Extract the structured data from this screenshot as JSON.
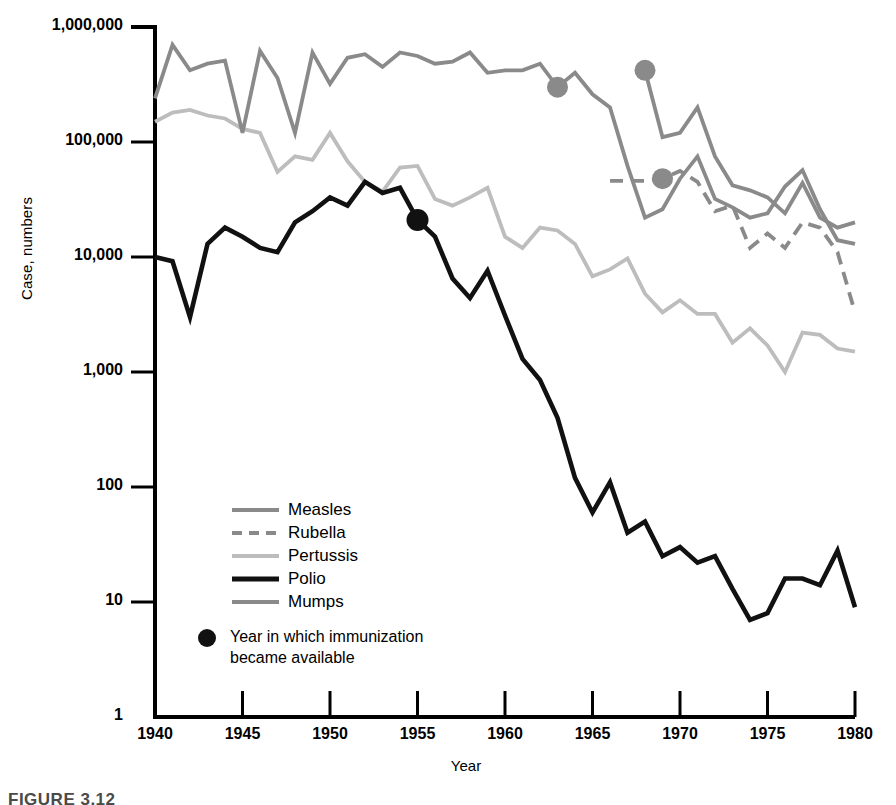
{
  "axes": {
    "y_label": "Case, numbers",
    "x_label": "Year",
    "y_ticks": [
      "1,000,000",
      "100,000",
      "10,000",
      "1,000",
      "100",
      "10",
      "1"
    ],
    "x_ticks": [
      "1940",
      "1945",
      "1950",
      "1955",
      "1960",
      "1965",
      "1970",
      "1975",
      "1980"
    ]
  },
  "legend": {
    "items": [
      {
        "label": "Measles",
        "color": "#8a8a8a",
        "style": "solid"
      },
      {
        "label": "Rubella",
        "color": "#8a8a8a",
        "style": "dashed"
      },
      {
        "label": "Pertussis",
        "color": "#bdbdbd",
        "style": "solid"
      },
      {
        "label": "Polio",
        "color": "#111111",
        "style": "solid"
      },
      {
        "label": "Mumps",
        "color": "#8a8a8a",
        "style": "solid"
      }
    ]
  },
  "note": {
    "text": "Year in which immunization\nbecame available",
    "marker_color": "#111111"
  },
  "caption": "FIGURE 3.12",
  "chart_data": {
    "type": "line",
    "title": "",
    "xlabel": "Year",
    "ylabel": "Case, numbers",
    "yscale": "log",
    "xlim": [
      1940,
      1980
    ],
    "ylim": [
      1,
      1000000
    ],
    "grid": false,
    "legend_position": "inside-lower-left",
    "annotations": [
      {
        "text": "Year in which immunization became available",
        "marker": "filled-circle"
      },
      {
        "series": "Polio",
        "year": 1955,
        "value": 21000,
        "note": "immunization available"
      },
      {
        "series": "Measles",
        "year": 1963,
        "value": 300000,
        "note": "immunization available"
      },
      {
        "series": "Mumps",
        "year": 1968,
        "value": 420000,
        "note": "immunization available"
      },
      {
        "series": "Rubella",
        "year": 1969,
        "value": 48000,
        "note": "immunization available"
      }
    ],
    "series": [
      {
        "name": "Measles",
        "color": "#8a8a8a",
        "style": "solid",
        "x": [
          1940,
          1941,
          1942,
          1943,
          1944,
          1945,
          1946,
          1947,
          1948,
          1949,
          1950,
          1951,
          1952,
          1953,
          1954,
          1955,
          1956,
          1957,
          1958,
          1959,
          1960,
          1961,
          1962,
          1963,
          1964,
          1965,
          1966,
          1967,
          1968,
          1969,
          1970,
          1971,
          1972,
          1973,
          1974,
          1975,
          1976,
          1977,
          1978,
          1979,
          1980
        ],
        "y": [
          240000,
          700000,
          420000,
          480000,
          510000,
          120000,
          620000,
          360000,
          120000,
          600000,
          320000,
          540000,
          580000,
          450000,
          600000,
          560000,
          480000,
          500000,
          600000,
          400000,
          420000,
          420000,
          480000,
          300000,
          400000,
          260000,
          200000,
          62000,
          22000,
          26000,
          48000,
          75000,
          32000,
          27000,
          22000,
          24000,
          41000,
          57000,
          26000,
          14000,
          13000
        ]
      },
      {
        "name": "Rubella",
        "color": "#8a8a8a",
        "style": "dashed",
        "x": [
          1966,
          1967,
          1968,
          1969,
          1970,
          1971,
          1972,
          1973,
          1974,
          1975,
          1976,
          1977,
          1978,
          1979,
          1980
        ],
        "y": [
          46000,
          46000,
          46000,
          48000,
          56000,
          45000,
          25000,
          28000,
          12000,
          16000,
          12000,
          20000,
          18000,
          11000,
          3300
        ]
      },
      {
        "name": "Pertussis",
        "color": "#bdbdbd",
        "style": "solid",
        "x": [
          1940,
          1941,
          1942,
          1943,
          1944,
          1945,
          1946,
          1947,
          1948,
          1949,
          1950,
          1951,
          1952,
          1953,
          1954,
          1955,
          1956,
          1957,
          1958,
          1959,
          1960,
          1961,
          1962,
          1963,
          1964,
          1965,
          1966,
          1967,
          1968,
          1969,
          1970,
          1971,
          1972,
          1973,
          1974,
          1975,
          1976,
          1977,
          1978,
          1979,
          1980
        ],
        "y": [
          150000,
          180000,
          190000,
          170000,
          160000,
          130000,
          120000,
          55000,
          75000,
          70000,
          120000,
          68000,
          45000,
          37000,
          60000,
          62000,
          32000,
          28000,
          33000,
          40000,
          15000,
          12000,
          18000,
          17000,
          13000,
          6800,
          7800,
          9700,
          4800,
          3300,
          4200,
          3200,
          3200,
          1800,
          2400,
          1700,
          1000,
          2200,
          2100,
          1600,
          1500
        ]
      },
      {
        "name": "Polio",
        "color": "#111111",
        "style": "solid",
        "x": [
          1940,
          1941,
          1942,
          1943,
          1944,
          1945,
          1946,
          1947,
          1948,
          1949,
          1950,
          1951,
          1952,
          1953,
          1954,
          1955,
          1956,
          1957,
          1958,
          1959,
          1960,
          1961,
          1962,
          1963,
          1964,
          1965,
          1966,
          1967,
          1968,
          1969,
          1970,
          1971,
          1972,
          1973,
          1974,
          1975,
          1976,
          1977,
          1978,
          1979,
          1980
        ],
        "y": [
          10000,
          9200,
          3000,
          13000,
          18000,
          15000,
          12000,
          11000,
          20000,
          25000,
          33000,
          28000,
          45000,
          36000,
          40000,
          21000,
          15000,
          6500,
          4400,
          7600,
          3100,
          1300,
          850,
          400,
          120,
          60,
          110,
          40,
          50,
          25,
          30,
          22,
          25,
          13,
          7,
          8,
          16,
          16,
          14,
          28,
          9
        ]
      },
      {
        "name": "Mumps",
        "color": "#8a8a8a",
        "style": "solid",
        "x": [
          1968,
          1969,
          1970,
          1971,
          1972,
          1973,
          1974,
          1975,
          1976,
          1977,
          1978,
          1979,
          1980
        ],
        "y": [
          420000,
          110000,
          120000,
          200000,
          75000,
          42000,
          38000,
          33000,
          24000,
          44000,
          22000,
          18000,
          20000
        ]
      }
    ]
  }
}
